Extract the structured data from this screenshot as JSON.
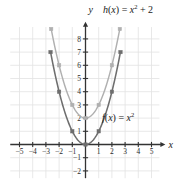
{
  "figure": {
    "axis_labels": {
      "x": "x",
      "y": "y"
    },
    "curve_labels": {
      "upper": {
        "text": "h(x) = x² + 2",
        "name": "h",
        "expression": "x^2 + 2"
      },
      "lower": {
        "text": "f(x) = x²",
        "name": "f",
        "expression": "x^2"
      }
    },
    "colors": {
      "axis": "#333333",
      "grid": "#e2e2e2",
      "curve_f": "#6e6e6e",
      "curve_h": "#b0b0b0",
      "text": "#1a1a1a",
      "background": "#ffffff"
    }
  },
  "chart_data": {
    "type": "line",
    "title": "",
    "xlabel": "x",
    "ylabel": "y",
    "xlim": [
      -5.8,
      5.8
    ],
    "ylim": [
      -2.6,
      8.9
    ],
    "grid": true,
    "legend": "inline-annotations",
    "xticks": [
      -5,
      -4,
      -3,
      -2,
      -1,
      1,
      2,
      3,
      4,
      5
    ],
    "xtick_labels": [
      "-5",
      "-4",
      "-3",
      "-2",
      "-1",
      "1",
      "2",
      "3",
      "4",
      "5"
    ],
    "yticks": [
      8,
      7,
      6,
      5,
      4,
      3,
      2,
      1,
      -1,
      -2
    ],
    "ytick_labels": [
      "8",
      "7",
      "6",
      "5",
      "4",
      "3",
      "2",
      "1",
      "-1",
      "-2"
    ],
    "series": [
      {
        "name": "f(x) = x²",
        "label": "f(x) = x²",
        "color": "#6e6e6e",
        "marker": "square",
        "x": [
          -2.65,
          -2,
          -1,
          0,
          1,
          2,
          2.65
        ],
        "y": [
          7,
          4,
          1,
          0,
          1,
          4,
          7
        ],
        "marker_points": [
          {
            "x": -2.65,
            "y": 7
          },
          {
            "x": -2,
            "y": 4
          },
          {
            "x": -1,
            "y": 1
          },
          {
            "x": 0,
            "y": 0
          },
          {
            "x": 1,
            "y": 1
          },
          {
            "x": 2,
            "y": 4
          },
          {
            "x": 2.65,
            "y": 7
          }
        ]
      },
      {
        "name": "h(x) = x² + 2",
        "label": "h(x) = x² + 2",
        "color": "#b0b0b0",
        "marker": "square",
        "x": [
          -2.6,
          -2,
          -1,
          0,
          1,
          2,
          2.6
        ],
        "y": [
          8.75,
          6,
          3,
          2,
          3,
          6,
          8.75
        ],
        "marker_points": [
          {
            "x": -2.6,
            "y": 8.75
          },
          {
            "x": -2,
            "y": 6
          },
          {
            "x": -1,
            "y": 3
          },
          {
            "x": 0,
            "y": 2
          },
          {
            "x": 1,
            "y": 3
          },
          {
            "x": 2,
            "y": 6
          },
          {
            "x": 2.6,
            "y": 8.75
          }
        ]
      }
    ]
  }
}
